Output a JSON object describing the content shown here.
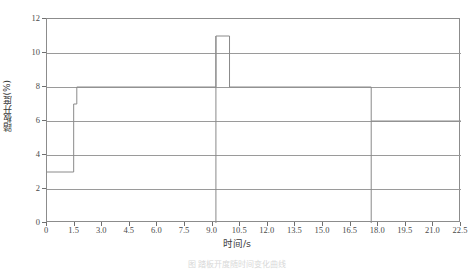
{
  "chart_data": {
    "type": "line",
    "title": "",
    "subtitle": "",
    "xlabel": "时间/s",
    "ylabel": "踏板开度(%)",
    "xlim": [
      0,
      22.5
    ],
    "ylim": [
      0,
      12
    ],
    "grid": true,
    "legend": "none",
    "line_color": "#8a8a8a",
    "grid_color": "#9a9a9a",
    "frame_color": "#8c8c8c",
    "x_ticks": [
      "0",
      "1.5",
      "3.0",
      "4.5",
      "6.0",
      "7.5",
      "9.0",
      "10.5",
      "12.0",
      "13.5",
      "15.0",
      "16.5",
      "18.0",
      "19.5",
      "21.0",
      "22.5"
    ],
    "x_tick_values": [
      0,
      1.5,
      3.0,
      4.5,
      6.0,
      7.5,
      9.0,
      10.5,
      12.0,
      13.5,
      15.0,
      16.5,
      18.0,
      19.5,
      21.0,
      22.5
    ],
    "y_ticks": [
      "0",
      "2",
      "4",
      "6",
      "8",
      "10",
      "12"
    ],
    "y_tick_values": [
      0,
      2,
      4,
      6,
      8,
      10,
      12
    ],
    "series": [
      {
        "name": "踏板开度",
        "step": "post",
        "x": [
          0.0,
          1.45,
          1.62,
          9.18,
          9.92,
          17.62,
          22.5
        ],
        "values": [
          3.0,
          7.0,
          8.0,
          11.0,
          8.0,
          6.0,
          6.0
        ]
      }
    ],
    "annotations": []
  },
  "caption": {
    "text": "图 踏板开度随时间变化曲线"
  }
}
